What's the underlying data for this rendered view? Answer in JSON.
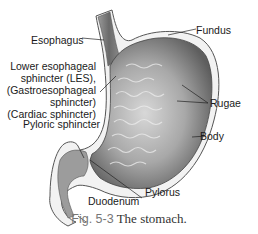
{
  "figure": {
    "caption_number": "Fig. 5-3",
    "caption_text": "The stomach."
  },
  "labels": {
    "esophagus": "Esophagus",
    "les_line1": "Lower esophageal",
    "les_line2": "sphincter (LES),",
    "les_line3": "(Gastroesophageal",
    "les_line4": "sphincter)",
    "les_line5": "(Cardiac sphincter)",
    "pyloric_sphincter": "Pyloric sphincter",
    "duodenum": "Duodenum",
    "pylorus": "Pylorus",
    "fundus": "Fundus",
    "rugae": "Rugae",
    "body": "Body"
  },
  "colors": {
    "outline": "#555555",
    "wall_light": "#eeeeee",
    "interior_dark": "#6e6e6e",
    "interior_light": "#c8c8c8",
    "caption_number": "#777777"
  }
}
